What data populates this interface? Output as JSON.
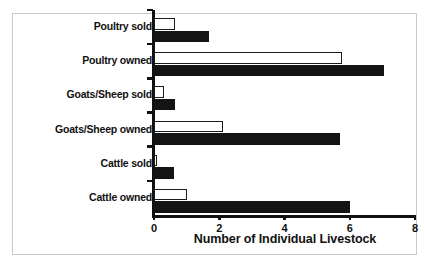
{
  "chart_data": {
    "type": "bar",
    "orientation": "horizontal",
    "title": "",
    "xlabel": "Number of Individual Livestock",
    "ylabel": "",
    "xlim": [
      0,
      8
    ],
    "xticks": [
      0,
      2,
      4,
      6,
      8
    ],
    "xtick_labels": [
      "0",
      "2",
      "4",
      "6",
      "8"
    ],
    "grid": false,
    "legend": "none",
    "categories": [
      "Cattle owned",
      "Cattle sold",
      "Goats/Sheep owned",
      "Goats/Sheep sold",
      "Poultry owned",
      "Poultry sold"
    ],
    "series": [
      {
        "name": "white-bar",
        "style": "open",
        "color": "#ffffff",
        "edge_color": "#1a1a1a",
        "values": [
          1.0,
          0.1,
          2.1,
          0.3,
          5.75,
          0.65
        ]
      },
      {
        "name": "black-bar",
        "style": "filled",
        "color": "#141414",
        "edge_color": "#141414",
        "values": [
          6.0,
          0.6,
          5.7,
          0.65,
          7.05,
          1.7
        ]
      }
    ]
  },
  "axis": {
    "x_title": "Number of Individual Livestock"
  },
  "category_labels": [
    "Poultry sold",
    "Poultry owned",
    "Goats/Sheep sold",
    "Goats/Sheep owned",
    "Cattle sold",
    "Cattle owned"
  ],
  "tick_labels": [
    "0",
    "2",
    "4",
    "6",
    "8"
  ],
  "colors": {
    "bar_dark": "#141414",
    "bar_light": "#ffffff",
    "axis": "#111111",
    "frame": "#c9c9c9",
    "background": "#ffffff"
  }
}
